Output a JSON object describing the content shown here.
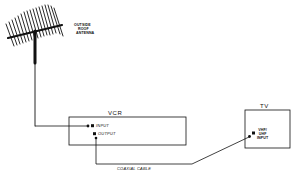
{
  "diagram": {
    "antenna": {
      "label_lines": [
        "OUTSIDE",
        "ROOF",
        "ANTENNA"
      ]
    },
    "vcr": {
      "title": "VCR",
      "ports": [
        {
          "label": "INPUT"
        },
        {
          "label": "OUTPUT"
        }
      ]
    },
    "tv": {
      "title": "TV",
      "port_label_lines": [
        "VHF/",
        "UHF",
        "INPUT"
      ]
    },
    "cable": {
      "label": "COAXIAL CABLE"
    },
    "colors": {
      "ink": "#111111",
      "background": "#ffffff"
    }
  }
}
